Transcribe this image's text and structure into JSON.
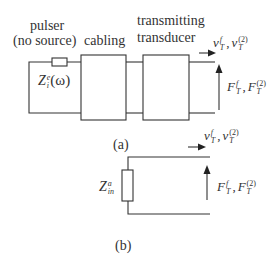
{
  "figure_a": {
    "labels": {
      "pulser": "pulser",
      "no_source": "(no source)",
      "cabling": "cabling",
      "transmitting": "transmitting",
      "transducer": "transducer",
      "caption": "(a)"
    },
    "impedance": {
      "base": "Z",
      "sup": "e",
      "sub": "i",
      "arg": "(ω)"
    },
    "velocity": {
      "v1": "v",
      "v1_sup": "f",
      "v1_sub": "T",
      "v2": "v",
      "v2_sup": "(2)",
      "v2_sub": "T"
    },
    "force": {
      "f1": "F",
      "f1_sup": "f",
      "f1_sub": "T",
      "f2": "F",
      "f2_sup": "(2)",
      "f2_sub": "T"
    }
  },
  "figure_b": {
    "labels": {
      "caption": "(b)"
    },
    "impedance": {
      "base": "Z",
      "sup": "a",
      "sub": "in"
    },
    "velocity": {
      "v1": "v",
      "v1_sup": "f",
      "v1_sub": "T",
      "v2": "v",
      "v2_sup": "(2)",
      "v2_sub": "T"
    },
    "force": {
      "f1": "F",
      "f1_sup": "f",
      "f1_sub": "T",
      "f2": "F",
      "f2_sup": "(2)",
      "f2_sub": "T"
    }
  },
  "colors": {
    "line": "#333333",
    "background": "#ffffff"
  }
}
